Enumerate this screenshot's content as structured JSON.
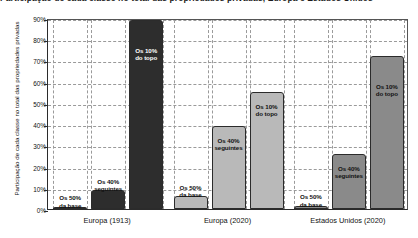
{
  "chart_data": {
    "type": "bar",
    "title": "Participação de cada classe no total das propriedades privadas, Europa e Estados Unidos",
    "xlabel": "",
    "ylabel": "Participação de cada classe no total das propriedades privadas",
    "ylim": [
      0,
      90
    ],
    "ytick_labels": [
      "0%",
      "10%",
      "20%",
      "30%",
      "40%",
      "50%",
      "60%",
      "70%",
      "80%",
      "90%"
    ],
    "ytick_values": [
      0,
      10,
      20,
      30,
      40,
      50,
      60,
      70,
      80,
      90
    ],
    "grid": true,
    "legend": "none",
    "categories": [
      "Europa (1913)",
      "Europa (2020)",
      "Estados Unidos (2020)"
    ],
    "series": [
      {
        "name": "Os 50% da base",
        "label_line1": "Os 50%",
        "label_line2": "da base",
        "values": [
          1,
          6,
          1.5
        ]
      },
      {
        "name": "Os 40% seguintes",
        "label_line1": "Os 40%",
        "label_line2": "seguintes",
        "values": [
          9,
          39,
          26
        ]
      },
      {
        "name": "Os 10% do topo",
        "label_line1": "Os 10%",
        "label_line2": "do topo",
        "values": [
          89,
          55,
          72
        ]
      }
    ],
    "group_colors": [
      "#2d2d2d",
      "#b9b9b9",
      "#8a8a8a"
    ],
    "colors": {
      "europa_1913_fill": "#2d2d2d",
      "europa_2020_fill": "#b9b9b9",
      "estados_unidos_2020_fill": "#8a8a8a",
      "axis": "#2b2b2b",
      "grid": "#9a9a9a",
      "background": "#ffffff"
    }
  }
}
